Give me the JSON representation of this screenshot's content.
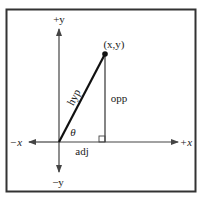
{
  "diagram": {
    "labels": {
      "pos_y": "+y",
      "neg_y": "−y",
      "pos_x": "+x",
      "neg_x": "−x",
      "point": "(x,y)",
      "hypotenuse": "hyp",
      "opposite": "opp",
      "adjacent": "adj",
      "angle": "θ"
    },
    "colors": {
      "stroke": "#222222",
      "frame": "#333333",
      "background": "#ffffff"
    }
  }
}
